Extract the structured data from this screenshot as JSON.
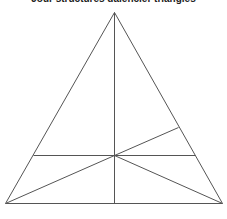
{
  "title": "Jour structures dalencier triangles",
  "diagram": {
    "stroke_color": "#555555",
    "stroke_width": 1,
    "vertices": {
      "apex": [
        114,
        12
      ],
      "bottom_left": [
        5,
        203
      ],
      "bottom_right": [
        222,
        203
      ],
      "center": [
        114,
        155
      ]
    },
    "segments": [
      {
        "name": "left-side",
        "from": [
          114,
          12
        ],
        "to": [
          5,
          203
        ]
      },
      {
        "name": "right-side",
        "from": [
          114,
          12
        ],
        "to": [
          222,
          203
        ]
      },
      {
        "name": "base",
        "from": [
          5,
          203
        ],
        "to": [
          222,
          203
        ]
      },
      {
        "name": "median-vertical",
        "from": [
          114,
          12
        ],
        "to": [
          114,
          203
        ]
      },
      {
        "name": "horizontal-line",
        "from": [
          33,
          155
        ],
        "to": [
          195,
          155
        ]
      },
      {
        "name": "center-to-bottom-left",
        "from": [
          114,
          155
        ],
        "to": [
          5,
          203
        ]
      },
      {
        "name": "center-to-bottom-right",
        "from": [
          114,
          155
        ],
        "to": [
          222,
          203
        ]
      },
      {
        "name": "center-to-right-side",
        "from": [
          114,
          155
        ],
        "to": [
          178,
          127
        ]
      }
    ]
  }
}
